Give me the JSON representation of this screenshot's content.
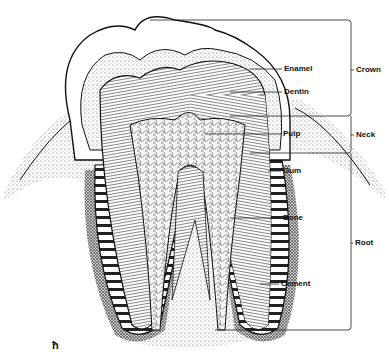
{
  "diagram": {
    "structure_labels": [
      {
        "id": "enamel",
        "text": "Enamel",
        "x": 284,
        "y": 64
      },
      {
        "id": "dentin",
        "text": "Dentin",
        "x": 284,
        "y": 87
      },
      {
        "id": "pulp",
        "text": "Pulp",
        "x": 283,
        "y": 129
      },
      {
        "id": "gum",
        "text": "Gum",
        "x": 283,
        "y": 166
      },
      {
        "id": "bone",
        "text": "Bone",
        "x": 283,
        "y": 213
      },
      {
        "id": "cement",
        "text": "Cement",
        "x": 281,
        "y": 279
      }
    ],
    "region_labels": [
      {
        "id": "crown",
        "text": "Crown",
        "x": 356,
        "y": 67
      },
      {
        "id": "neck",
        "text": "Neck",
        "x": 356,
        "y": 132
      },
      {
        "id": "root",
        "text": "Root",
        "x": 355,
        "y": 240
      }
    ],
    "signature": "ħ",
    "colors": {
      "ink": "#111111",
      "background": "#ffffff"
    }
  }
}
